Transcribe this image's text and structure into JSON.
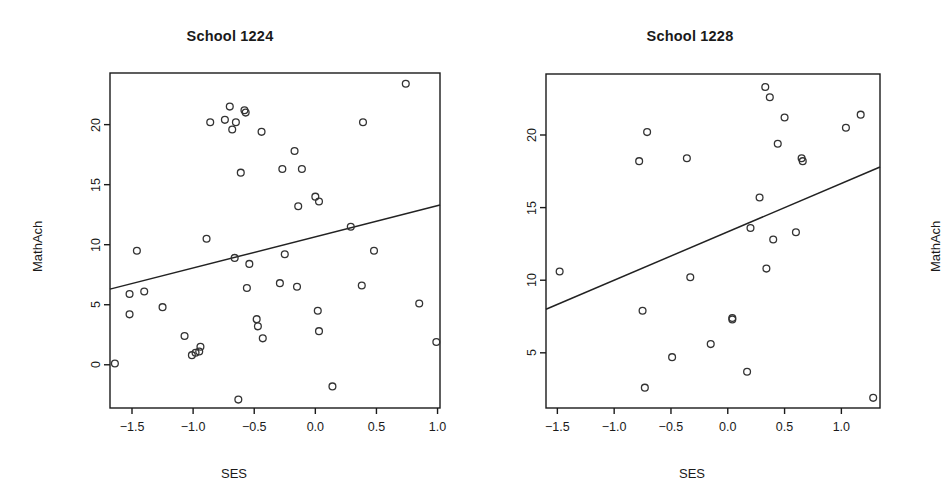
{
  "figure": {
    "background": "#ffffff",
    "foreground": "#1a1a1a",
    "point_color": "#333333",
    "line_color": "#222222"
  },
  "chart_data": [
    {
      "type": "scatter",
      "title": "School 1224",
      "xlabel": "SES",
      "ylabel": "MathAch",
      "xlim": [
        -1.68,
        1.02
      ],
      "ylim": [
        -3.6,
        24.3
      ],
      "grid": false,
      "legend": null,
      "xticks": [
        -1.5,
        -1.0,
        -0.5,
        0.0,
        0.5,
        1.0
      ],
      "xticklabels": [
        "-1.5",
        "-1.0",
        "-0.5",
        "0.0",
        "0.5",
        "1.0"
      ],
      "yticks": [
        0,
        5,
        10,
        15,
        20
      ],
      "yticklabels": [
        "0",
        "5",
        "10",
        "15",
        "20"
      ],
      "points": [
        [
          -1.64,
          0.1
        ],
        [
          -1.52,
          5.9
        ],
        [
          -1.52,
          4.2
        ],
        [
          -1.46,
          9.5
        ],
        [
          -1.4,
          6.1
        ],
        [
          -1.25,
          4.8
        ],
        [
          -1.07,
          2.4
        ],
        [
          -1.01,
          0.8
        ],
        [
          -0.98,
          1.0
        ],
        [
          -0.95,
          1.1
        ],
        [
          -0.94,
          1.5
        ],
        [
          -0.89,
          10.5
        ],
        [
          -0.86,
          20.2
        ],
        [
          -0.74,
          20.4
        ],
        [
          -0.7,
          21.5
        ],
        [
          -0.68,
          19.6
        ],
        [
          -0.66,
          8.9
        ],
        [
          -0.65,
          20.2
        ],
        [
          -0.63,
          -2.9
        ],
        [
          -0.61,
          16.0
        ],
        [
          -0.58,
          21.2
        ],
        [
          -0.57,
          21.0
        ],
        [
          -0.56,
          6.4
        ],
        [
          -0.54,
          8.4
        ],
        [
          -0.48,
          3.8
        ],
        [
          -0.47,
          3.2
        ],
        [
          -0.44,
          19.4
        ],
        [
          -0.43,
          2.2
        ],
        [
          -0.29,
          6.8
        ],
        [
          -0.27,
          16.3
        ],
        [
          -0.25,
          9.2
        ],
        [
          -0.17,
          17.8
        ],
        [
          -0.15,
          6.5
        ],
        [
          -0.14,
          13.2
        ],
        [
          -0.11,
          16.3
        ],
        [
          0.0,
          14.0
        ],
        [
          0.02,
          4.5
        ],
        [
          0.03,
          13.6
        ],
        [
          0.03,
          2.8
        ],
        [
          0.14,
          -1.8
        ],
        [
          0.29,
          11.5
        ],
        [
          0.38,
          6.6
        ],
        [
          0.39,
          20.2
        ],
        [
          0.48,
          9.5
        ],
        [
          0.74,
          23.4
        ],
        [
          0.85,
          5.1
        ],
        [
          0.99,
          1.9
        ]
      ],
      "fit_line": {
        "x": [
          -1.68,
          1.02
        ],
        "y": [
          6.3,
          13.3
        ]
      }
    },
    {
      "type": "scatter",
      "title": "School 1228",
      "xlabel": "SES",
      "ylabel": "MathAch",
      "xlim": [
        -1.6,
        1.34
      ],
      "ylim": [
        1.2,
        24.2
      ],
      "grid": false,
      "legend": null,
      "xticks": [
        -1.5,
        -1.0,
        -0.5,
        0.0,
        0.5,
        1.0
      ],
      "xticklabels": [
        "-1.5",
        "-1.0",
        "-0.5",
        "0.0",
        "0.5",
        "1.0"
      ],
      "yticks": [
        5,
        10,
        15,
        20
      ],
      "yticklabels": [
        "5",
        "10",
        "15",
        "20"
      ],
      "points": [
        [
          -1.48,
          10.6
        ],
        [
          -0.78,
          18.2
        ],
        [
          -0.75,
          7.9
        ],
        [
          -0.73,
          2.6
        ],
        [
          -0.71,
          20.2
        ],
        [
          -0.49,
          4.7
        ],
        [
          -0.36,
          18.4
        ],
        [
          -0.33,
          10.2
        ],
        [
          -0.15,
          5.6
        ],
        [
          0.04,
          7.4
        ],
        [
          0.04,
          7.3
        ],
        [
          0.17,
          3.7
        ],
        [
          0.2,
          13.6
        ],
        [
          0.28,
          15.7
        ],
        [
          0.33,
          23.3
        ],
        [
          0.34,
          10.8
        ],
        [
          0.37,
          22.6
        ],
        [
          0.4,
          12.8
        ],
        [
          0.44,
          19.4
        ],
        [
          0.5,
          21.2
        ],
        [
          0.6,
          13.3
        ],
        [
          0.65,
          18.4
        ],
        [
          0.66,
          18.2
        ],
        [
          1.04,
          20.5
        ],
        [
          1.17,
          21.4
        ],
        [
          1.28,
          1.9
        ]
      ],
      "fit_line": {
        "x": [
          -1.6,
          1.34
        ],
        "y": [
          8.0,
          17.8
        ]
      }
    }
  ]
}
